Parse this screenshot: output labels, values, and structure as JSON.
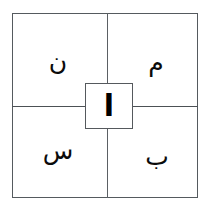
{
  "diagram": {
    "name": "four-quadrant-square-with-central-cell",
    "background_color": "#ffffff",
    "line_color": "#55595d",
    "glyph_color": "#0b0b0b",
    "center": {
      "label": "ا",
      "transliteration": "alif"
    },
    "quadrants": [
      {
        "position": "top-left",
        "label": "ن",
        "transliteration": "noon"
      },
      {
        "position": "top-right",
        "label": "م",
        "transliteration": "meem"
      },
      {
        "position": "bottom-left",
        "label": "س",
        "transliteration": "seen"
      },
      {
        "position": "bottom-right",
        "label": "ب",
        "transliteration": "beh"
      }
    ]
  }
}
